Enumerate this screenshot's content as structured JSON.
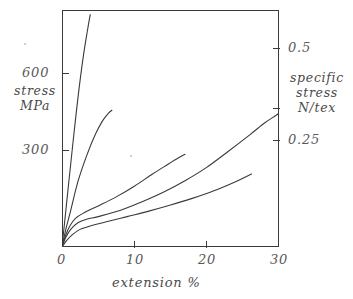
{
  "figure": {
    "name": "stress-extension-curves",
    "background": "#ffffff",
    "line_color": "#3a3a3a",
    "text_color": "#4a4a4a"
  },
  "axes": {
    "x": {
      "title": "extension %",
      "ticks": [
        "0",
        "10",
        "20",
        "30"
      ],
      "tick_values": [
        0,
        10,
        20,
        30
      ],
      "range": [
        0,
        30
      ]
    },
    "y_left": {
      "title_line1": "stress",
      "title_line2": "MPa",
      "ticks": [
        "300",
        "600"
      ],
      "tick_values": [
        300,
        600
      ],
      "range": [
        0,
        780
      ]
    },
    "y_right": {
      "title_line1": "specific",
      "title_line2": "stress",
      "title_line3": "N/tex",
      "ticks": [
        "0.25",
        "0.5"
      ],
      "tick_values": [
        0.25,
        0.5
      ],
      "range": [
        0,
        0.65
      ]
    }
  },
  "chart_data": {
    "type": "line",
    "title": "",
    "subtitle": "",
    "xlabel": "extension %",
    "ylabel": "stress MPa",
    "y2label": "specific stress N/tex",
    "xlim": [
      0,
      30
    ],
    "ylim": [
      0,
      780
    ],
    "y2lim": [
      0,
      0.65
    ],
    "grid": false,
    "legend": "none",
    "xticks": [
      0,
      10,
      20,
      30
    ],
    "xticklabels": [
      "0",
      "10",
      "20",
      "30"
    ],
    "yticks": [
      300,
      600
    ],
    "yticklabels": [
      "300",
      "600"
    ],
    "y2ticks": [
      0.25,
      0.5
    ],
    "y2ticklabels": [
      "0.25",
      "0.5"
    ],
    "series": [
      {
        "name": "curve-1-steepest",
        "x": [
          0.0,
          0.4,
          0.9,
          1.5,
          2.2,
          2.9,
          3.5,
          3.9
        ],
        "y": [
          0,
          90,
          205,
          340,
          490,
          620,
          710,
          765
        ]
      },
      {
        "name": "curve-2",
        "x": [
          0.0,
          0.5,
          1.2,
          2.2,
          3.4,
          4.6,
          5.6,
          6.4,
          6.9
        ],
        "y": [
          0,
          55,
          120,
          215,
          300,
          370,
          415,
          440,
          450
        ]
      },
      {
        "name": "curve-3",
        "x": [
          0.0,
          0.5,
          1.1,
          1.9,
          3.0,
          5.0,
          7.5,
          10.0,
          12.5,
          14.5,
          16.0,
          17.0
        ],
        "y": [
          0,
          38,
          70,
          95,
          112,
          135,
          165,
          200,
          240,
          270,
          292,
          305
        ]
      },
      {
        "name": "curve-4",
        "x": [
          0.0,
          0.5,
          1.2,
          2.2,
          3.5,
          5.0,
          8.0,
          11.0,
          14.0,
          17.0,
          20.0,
          23.0,
          26.0,
          28.0,
          29.5,
          30.0
        ],
        "y": [
          0,
          30,
          58,
          80,
          92,
          100,
          120,
          148,
          180,
          218,
          262,
          315,
          370,
          408,
          432,
          440
        ]
      },
      {
        "name": "curve-5-lowest",
        "x": [
          0.0,
          0.6,
          1.4,
          2.5,
          4.0,
          6.0,
          9.0,
          12.0,
          15.0,
          18.0,
          21.0,
          24.0,
          25.5,
          26.2
        ],
        "y": [
          0,
          20,
          40,
          58,
          70,
          82,
          100,
          118,
          138,
          160,
          185,
          215,
          232,
          240
        ]
      }
    ]
  }
}
